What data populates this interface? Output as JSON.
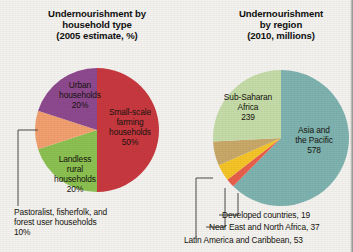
{
  "background_color": "#f4f3ef",
  "chart_data": [
    {
      "type": "pie",
      "id": "household-type",
      "title_lines": [
        "Undernourishment by",
        "household type",
        "(2005 estimate, %)"
      ],
      "title": "Undernourishment by household type (2005 estimate, %)",
      "unit": "%",
      "center": [
        97,
        130
      ],
      "radius": 62,
      "start_angle": 0,
      "direction": "clockwise",
      "categories": [
        "Small-scale farming households",
        "Landless rural households",
        "Pastoralist, fisherfolk, and forest user households",
        "Urban households"
      ],
      "values": [
        50,
        20,
        10,
        20
      ],
      "colors": [
        "#c8393f",
        "#8cc152",
        "#f2a070",
        "#8e4a8e"
      ],
      "slices": [
        {
          "name": "Small-scale farming households",
          "value": 50,
          "color": "#c8393f",
          "label_lines": [
            "Small-scale",
            "farming",
            "households",
            "50%"
          ],
          "label_pos": [
            130,
            115
          ],
          "label_style": "inside"
        },
        {
          "name": "Landless rural households",
          "value": 20,
          "color": "#8cc152",
          "label_lines": [
            "Landless",
            "rural",
            "households",
            "20%"
          ],
          "label_pos": [
            75,
            162
          ],
          "label_style": "inside"
        },
        {
          "name": "Pastoralist, fisherfolk, and forest user households",
          "value": 10,
          "color": "#f2a070",
          "label_lines": [
            "Pastoralist, fisherfolk, and",
            "forest user households",
            "10%"
          ],
          "label_pos": [
            14,
            215
          ],
          "label_style": "callout",
          "leader": "M 38,130 L 18,130 L 18,206"
        },
        {
          "name": "Urban households",
          "value": 20,
          "color": "#8e4a8e",
          "label_lines": [
            "Urban",
            "households",
            "20%"
          ],
          "label_pos": [
            80,
            88
          ],
          "label_style": "inside"
        }
      ]
    },
    {
      "type": "pie",
      "id": "region",
      "title_lines": [
        "Undernourishment",
        "by region",
        "(2010, millions)"
      ],
      "title": "Undernourishment by region (2010, millions)",
      "unit": "millions",
      "center": [
        281,
        138
      ],
      "radius": 68,
      "start_angle": 0,
      "direction": "clockwise",
      "categories": [
        "Asia and the Pacific",
        "Developed countries",
        "Near East and North Africa",
        "Latin America and Caribbean",
        "Sub-Saharan Africa"
      ],
      "values": [
        578,
        19,
        37,
        53,
        239
      ],
      "colors": [
        "#7fb3b0",
        "#e8604c",
        "#f5c427",
        "#c9a96a",
        "#c5dca8"
      ],
      "slices": [
        {
          "name": "Asia and the Pacific",
          "value": 578,
          "color": "#7fb3b0",
          "label_lines": [
            "Asia and",
            "the Pacific",
            "578"
          ],
          "label_pos": [
            314,
            133
          ],
          "label_style": "inside"
        },
        {
          "name": "Developed countries",
          "value": 19,
          "color": "#e8604c",
          "label_lines": [
            "Developed countries, 19"
          ],
          "label_pos": [
            222,
            218
          ],
          "label_style": "callout",
          "leader": "M 238,193 L 238,215 L 219,215"
        },
        {
          "name": "Near East and North Africa",
          "value": 37,
          "color": "#f5c427",
          "label_lines": [
            "Near East and North Africa, 37"
          ],
          "label_pos": [
            209,
            230
          ],
          "label_style": "callout",
          "leader": "M 225,188 L 225,227 L 206,227"
        },
        {
          "name": "Latin America and Caribbean",
          "value": 53,
          "color": "#c9a96a",
          "label_lines": [
            "Latin America and Caribbean, 53"
          ],
          "label_pos": [
            184,
            243
          ],
          "label_style": "callout",
          "leader": "M 213,178 L 196,178 L 196,239"
        },
        {
          "name": "Sub-Saharan Africa",
          "value": 239,
          "color": "#c5dca8",
          "label_lines": [
            "Sub-Saharan",
            "Africa",
            "239"
          ],
          "label_pos": [
            248,
            100
          ],
          "label_style": "inside"
        }
      ]
    }
  ]
}
